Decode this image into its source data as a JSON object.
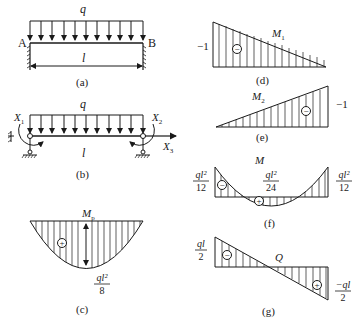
{
  "figures": {
    "a": {
      "caption": "(a)",
      "load_label": "q",
      "left_support_label": "A",
      "right_support_label": "B",
      "span_label": "l",
      "description": "Fixed-fixed beam under uniform load q"
    },
    "b": {
      "caption": "(b)",
      "load_label": "q",
      "span_label": "l",
      "x1": "X",
      "x1_sub": "1",
      "x2": "X",
      "x2_sub": "2",
      "x3": "X",
      "x3_sub": "3",
      "description": "Basic system with redundant forces X1, X2, X3"
    },
    "c": {
      "caption": "(c)",
      "title": "M",
      "title_sub": "p",
      "sign": "+",
      "value_num": "ql²",
      "value_den": "8"
    },
    "d": {
      "caption": "(d)",
      "title": "M",
      "title_sub": "1",
      "sign": "−",
      "value": "−1"
    },
    "e": {
      "caption": "(e)",
      "title": "M",
      "title_sub": "2",
      "sign": "−",
      "value": "−1"
    },
    "f": {
      "caption": "(f)",
      "title": "M",
      "left_num": "ql²",
      "left_den": "12",
      "mid_num": "ql²",
      "mid_den": "24",
      "right_num": "ql²",
      "right_den": "12",
      "sign_left": "−",
      "sign_mid": "+"
    },
    "g": {
      "caption": "(g)",
      "title": "Q",
      "left_num": "ql",
      "left_den": "2",
      "right_num": "−ql",
      "right_den": "2",
      "sign_left": "−",
      "sign_right": "+"
    }
  },
  "colors": {
    "ink": "#1a1a1a",
    "background": "#ffffff"
  }
}
